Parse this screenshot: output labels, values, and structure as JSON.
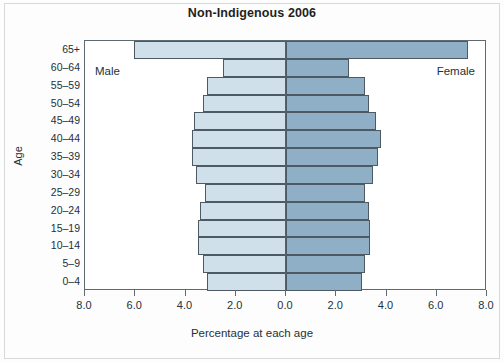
{
  "chart_data": {
    "type": "bar",
    "subtype": "population-pyramid",
    "title": "Non-Indigenous 2006",
    "xlabel": "Percentage at each age",
    "ylabel": "Age",
    "categories": [
      "0–4",
      "5–9",
      "10–14",
      "15–19",
      "20–24",
      "25–29",
      "30–34",
      "35–39",
      "40–44",
      "45–49",
      "50–54",
      "55–59",
      "60–64",
      "65+"
    ],
    "series": [
      {
        "name": "Male",
        "side": "left",
        "color": "#cfe0ea",
        "values": [
          3.16,
          3.32,
          3.52,
          3.52,
          3.44,
          3.24,
          3.6,
          3.76,
          3.76,
          3.68,
          3.32,
          3.16,
          2.52,
          6.05
        ]
      },
      {
        "name": "Female",
        "side": "right",
        "color": "#8fafc6",
        "values": [
          3.04,
          3.16,
          3.36,
          3.36,
          3.3,
          3.16,
          3.48,
          3.68,
          3.8,
          3.6,
          3.32,
          3.16,
          2.52,
          7.24
        ]
      }
    ],
    "xticks": [
      {
        "label": "8.0",
        "value": -8.0
      },
      {
        "label": "6.0",
        "value": -6.0
      },
      {
        "label": "4.0",
        "value": -4.0
      },
      {
        "label": "2.0",
        "value": -2.0
      },
      {
        "label": "0.0",
        "value": 0.0
      },
      {
        "label": "2.0",
        "value": 2.0
      },
      {
        "label": "4.0",
        "value": 4.0
      },
      {
        "label": "6.0",
        "value": 6.0
      },
      {
        "label": "8.0",
        "value": 8.0
      }
    ],
    "xlim": [
      -8.0,
      8.0
    ],
    "grid": false,
    "legend_position": "in-plot-corners",
    "annotations": [
      {
        "text": "Male",
        "position": "top-left-inside"
      },
      {
        "text": "Female",
        "position": "top-right-inside"
      }
    ]
  },
  "labels": {
    "male": "Male",
    "female": "Female"
  },
  "colors": {
    "male_bar": "#cfe0ea",
    "female_bar": "#8fafc6",
    "bar_outline": "#4d5a64",
    "axis": "#5d6a72",
    "text": "#23313a"
  }
}
